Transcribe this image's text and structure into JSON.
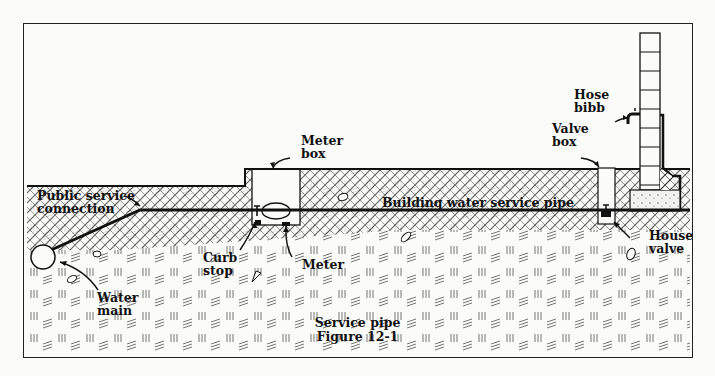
{
  "figure": {
    "title": "Service pipe",
    "number": "Figure 12-1"
  },
  "labels": {
    "public_service_connection": [
      "Public service",
      "connection"
    ],
    "water_main": [
      "Water",
      "main"
    ],
    "curb_stop": [
      "Curb",
      "stop"
    ],
    "meter_box": [
      "Meter",
      "box"
    ],
    "meter": "Meter",
    "building_water_service_pipe": "Building water service pipe",
    "valve_box": [
      "Valve",
      "box"
    ],
    "hose_bibb": [
      "Hose",
      "bibb"
    ],
    "house_valve": [
      "House",
      "valve"
    ]
  },
  "colors": {
    "ink": "#111111",
    "paper": "#fbfbf9",
    "soil": "#555555"
  }
}
